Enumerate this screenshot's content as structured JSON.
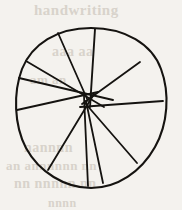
{
  "figure": {
    "caption": "",
    "background_color": "#f4f2ee",
    "ink_color": "#151310",
    "canvas": {
      "width": 182,
      "height": 210
    }
  },
  "ghost_text": {
    "line_1": "handwriting",
    "line_2": "aaa aa",
    "line_3": "am an",
    "line_4": "nannnn",
    "line_5": "an annnnnn nn",
    "line_6": "nn nnnnn nn",
    "line_7": "nnnn"
  },
  "chart_data": {
    "type": "pie",
    "xlabel": "",
    "ylabel": "",
    "grid": false,
    "legend_position": "none",
    "circle": {
      "center_x": 91,
      "center_y": 108,
      "radius_x": 76,
      "radius_y": 80,
      "bounds": {
        "left": 15,
        "right": 167,
        "top": 28,
        "bottom": 188
      },
      "outline_path": "M 91 28 C 125 28 152 44 161 69 C 170 93 168 124 155 147 C 141 172 117 188 91 188 C 65 188 39 172 26 148 C 14 125 13 93 22 69 C 32 44 57 28 91 28 Z",
      "stroke_width": 2.1
    },
    "hub": {
      "description": "chords converge in a small tangle slightly above-left of center",
      "x": 88,
      "y": 100
    },
    "categories": [
      "sector-1",
      "sector-2",
      "sector-3",
      "sector-4",
      "sector-5",
      "sector-6",
      "sector-7",
      "sector-8",
      "sector-9",
      "sector-10"
    ],
    "values": [
      10,
      10,
      10,
      10,
      10,
      10,
      10,
      10,
      10,
      10
    ],
    "chords": [
      {
        "name": "chord-top-vertical",
        "x1": 95,
        "y1": 29,
        "x2": 90,
        "y2": 107,
        "stroke_width": 1.9
      },
      {
        "name": "chord-upper-left",
        "x1": 58,
        "y1": 33,
        "x2": 88,
        "y2": 101,
        "stroke_width": 1.8
      },
      {
        "name": "chord-left-upper",
        "x1": 26,
        "y1": 61,
        "x2": 104,
        "y2": 107,
        "stroke_width": 1.8
      },
      {
        "name": "chord-left-mid",
        "x1": 19,
        "y1": 78,
        "x2": 113,
        "y2": 100,
        "stroke_width": 1.8
      },
      {
        "name": "chord-left-lower",
        "x1": 17,
        "y1": 110,
        "x2": 98,
        "y2": 92,
        "stroke_width": 1.8
      },
      {
        "name": "chord-lower-left-radial",
        "x1": 48,
        "y1": 170,
        "x2": 94,
        "y2": 94,
        "stroke_width": 1.8
      },
      {
        "name": "chord-bottom-left-vert",
        "x1": 88,
        "y1": 186,
        "x2": 84,
        "y2": 96,
        "stroke_width": 1.8
      },
      {
        "name": "chord-bottom-right-vert",
        "x1": 103,
        "y1": 183,
        "x2": 86,
        "y2": 101,
        "stroke_width": 1.8
      },
      {
        "name": "chord-lower-right",
        "x1": 137,
        "y1": 163,
        "x2": 85,
        "y2": 103,
        "stroke_width": 1.8
      },
      {
        "name": "chord-right-mid",
        "x1": 163,
        "y1": 101,
        "x2": 80,
        "y2": 107,
        "stroke_width": 1.8
      },
      {
        "name": "chord-upper-right",
        "x1": 140,
        "y1": 62,
        "x2": 82,
        "y2": 104,
        "stroke_width": 1.8
      }
    ]
  }
}
